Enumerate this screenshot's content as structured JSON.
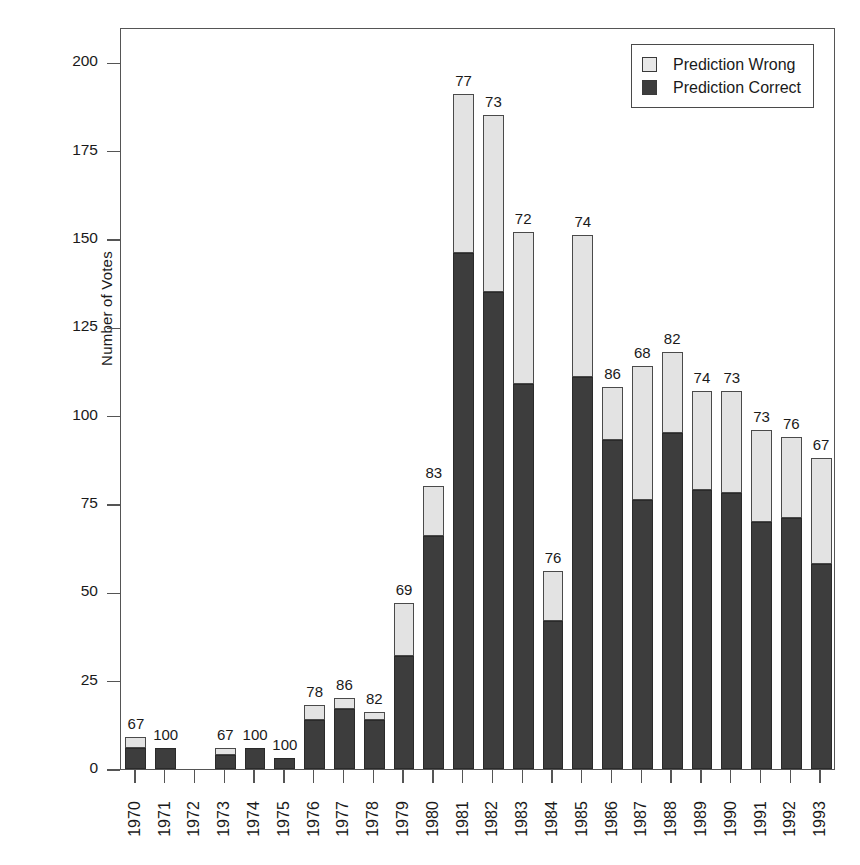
{
  "chart_data": {
    "type": "bar",
    "stacked": true,
    "title": "",
    "xlabel": "",
    "ylabel": "Number of Votes",
    "ylim": [
      0,
      210
    ],
    "yticks": [
      0,
      25,
      50,
      75,
      100,
      125,
      150,
      175,
      200
    ],
    "ytick_labels": [
      "0",
      "25",
      "50",
      "75",
      "100",
      "125",
      "150",
      "175",
      "200"
    ],
    "grid": false,
    "legend_position": "top-right",
    "categories": [
      "1970",
      "1971",
      "1972",
      "1973",
      "1974",
      "1975",
      "1976",
      "1977",
      "1978",
      "1979",
      "1980",
      "1981",
      "1982",
      "1983",
      "1984",
      "1985",
      "1986",
      "1987",
      "1988",
      "1989",
      "1990",
      "1991",
      "1992",
      "1993"
    ],
    "series": [
      {
        "name": "Prediction Correct",
        "color": "#3d3d3d",
        "values": [
          6,
          6,
          0,
          4,
          6,
          3,
          14,
          17,
          14,
          32,
          66,
          146,
          135,
          109,
          42,
          111,
          93,
          76,
          95,
          79,
          78,
          70,
          71,
          58
        ]
      },
      {
        "name": "Prediction Wrong",
        "color": "#e3e3e3",
        "values": [
          3,
          0,
          0,
          2,
          0,
          0,
          4,
          3,
          2,
          15,
          14,
          45,
          50,
          43,
          14,
          40,
          15,
          38,
          23,
          28,
          29,
          26,
          23,
          30
        ]
      }
    ],
    "totals": [
      9,
      6,
      0,
      6,
      6,
      3,
      18,
      20,
      16,
      47,
      80,
      191,
      185,
      152,
      56,
      151,
      108,
      114,
      118,
      107,
      107,
      96,
      94,
      88
    ],
    "bar_labels": [
      "67",
      "100",
      "",
      "67",
      "100",
      "100",
      "78",
      "86",
      "82",
      "69",
      "83",
      "77",
      "73",
      "72",
      "76",
      "74",
      "86",
      "68",
      "82",
      "74",
      "73",
      "73",
      "76",
      "67"
    ],
    "bar_label_note": "Percent of votes where prediction was correct"
  },
  "legend": {
    "items": [
      {
        "label": "Prediction Wrong",
        "swatch": "light-square-icon"
      },
      {
        "label": "Prediction Correct",
        "swatch": "dark-square-icon"
      }
    ]
  }
}
